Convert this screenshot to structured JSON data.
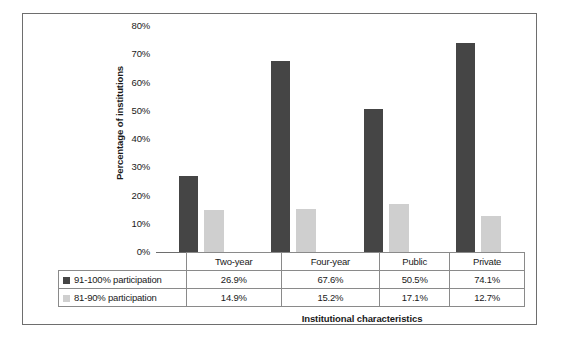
{
  "chart_data": {
    "type": "bar",
    "title": "",
    "xlabel": "Institutional characteristics",
    "ylabel": "Percentage of institutions",
    "categories": [
      "Two-year",
      "Four-year",
      "Public",
      "Private"
    ],
    "series": [
      {
        "name": "91-100% participation",
        "color": "#454545",
        "values": [
          26.9,
          67.6,
          50.5,
          74.1
        ],
        "labels": [
          "26.9%",
          "67.6%",
          "50.5%",
          "74.1%"
        ]
      },
      {
        "name": "81-90% participation",
        "color": "#cfcfcf",
        "values": [
          14.9,
          15.2,
          17.1,
          12.7
        ],
        "labels": [
          "14.9%",
          "15.2%",
          "17.1%",
          "12.7%"
        ]
      }
    ],
    "ylim": [
      0,
      80
    ],
    "ytick_values": [
      80,
      70,
      60,
      50,
      40,
      30,
      20,
      10,
      0
    ],
    "ytick_labels": [
      "80%",
      "70%",
      "60%",
      "50%",
      "40%",
      "30%",
      "20%",
      "10%",
      "0%"
    ],
    "grid": false,
    "legend_position": "table-left",
    "data_table": {
      "header_row": [
        "Two-year",
        "Four-year",
        "Public",
        "Private"
      ],
      "rows": [
        {
          "label": "91-100% participation",
          "swatch": "#454545",
          "cells": [
            "26.9%",
            "67.6%",
            "50.5%",
            "74.1%"
          ]
        },
        {
          "label": "81-90% participation",
          "swatch": "#cfcfcf",
          "cells": [
            "14.9%",
            "15.2%",
            "17.1%",
            "12.7%"
          ]
        }
      ]
    }
  },
  "colors": {
    "frame": "#6e6e6e",
    "table_border": "#8a8a8a",
    "text": "#1a1a1a",
    "background": "#ffffff"
  }
}
